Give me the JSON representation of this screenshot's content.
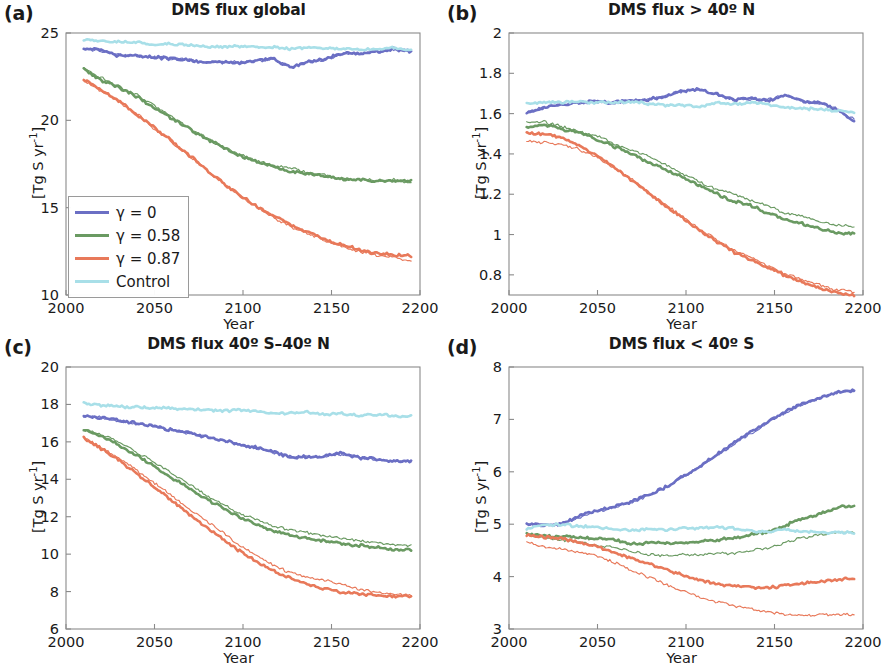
{
  "figure": {
    "panels": [
      {
        "letter": "(a)",
        "title": "DMS flux global",
        "xlabel": "Year",
        "ylabel": "[Tg S yr",
        "ylabel_sup": "-1",
        "ylabel_end": "]"
      },
      {
        "letter": "(b)",
        "title": "DMS flux > 40º N",
        "xlabel": "Year",
        "ylabel": "[Tg S yr",
        "ylabel_sup": "-1",
        "ylabel_end": "]"
      },
      {
        "letter": "(c)",
        "title": "DMS flux 40º S–40º N",
        "xlabel": "Year",
        "ylabel": "[Tg S yr",
        "ylabel_sup": "-1",
        "ylabel_end": "]"
      },
      {
        "letter": "(d)",
        "title": "DMS flux < 40º S",
        "xlabel": "Year",
        "ylabel": "[Tg S yr",
        "ylabel_sup": "-1",
        "ylabel_end": "]"
      }
    ]
  },
  "legend": {
    "position": "lower-left-panel-a",
    "items": [
      {
        "label": "γ = 0",
        "color": "#6b6fc4"
      },
      {
        "label": "γ = 0.58",
        "color": "#6a9a62"
      },
      {
        "label": "γ = 0.87",
        "color": "#e8795a"
      },
      {
        "label": "Control",
        "color": "#a8dfe8"
      }
    ]
  },
  "colors": {
    "gamma_0": "#6b6fc4",
    "gamma_058": "#6a9a62",
    "gamma_087": "#e8795a",
    "control": "#a8dfe8",
    "frame": "#8a8a8a",
    "text": "#1a1a1a",
    "background": "#ffffff"
  },
  "chart_data": [
    {
      "id": "a",
      "type": "line",
      "title": "DMS flux global",
      "xlabel": "Year",
      "ylabel": "[Tg S yr-1]",
      "xlim": [
        2000,
        2200
      ],
      "ylim": [
        10,
        25
      ],
      "xticks": [
        2000,
        2050,
        2100,
        2150,
        2200
      ],
      "yticks": [
        10,
        15,
        20,
        25
      ],
      "grid": false,
      "x": [
        2010,
        2020,
        2030,
        2040,
        2050,
        2060,
        2070,
        2080,
        2090,
        2100,
        2110,
        2120,
        2130,
        2140,
        2150,
        2160,
        2170,
        2180,
        2190,
        2195
      ],
      "series": [
        {
          "name": "γ = 0",
          "color": "#6b6fc4",
          "width": "thick",
          "values": [
            24.1,
            24.05,
            23.7,
            23.75,
            23.6,
            23.55,
            23.5,
            23.3,
            23.35,
            23.3,
            23.4,
            23.55,
            23.0,
            23.35,
            23.5,
            23.85,
            23.8,
            23.95,
            24.1,
            23.95
          ]
        },
        {
          "name": "γ = 0 (b)",
          "color": "#6b6fc4",
          "width": "thin",
          "values": [
            24.1,
            24.0,
            23.75,
            23.7,
            23.65,
            23.5,
            23.5,
            23.35,
            23.3,
            23.35,
            23.4,
            23.5,
            23.05,
            23.4,
            23.45,
            23.8,
            23.85,
            23.9,
            24.05,
            23.95
          ]
        },
        {
          "name": "γ = 0.58",
          "color": "#6a9a62",
          "width": "thick",
          "values": [
            22.95,
            22.3,
            21.9,
            21.4,
            20.8,
            20.2,
            19.6,
            19.0,
            18.5,
            18.0,
            17.65,
            17.35,
            17.05,
            16.95,
            16.8,
            16.65,
            16.6,
            16.5,
            16.55,
            16.5
          ]
        },
        {
          "name": "γ = 0.58 (b)",
          "color": "#6a9a62",
          "width": "thin",
          "values": [
            23.0,
            22.45,
            21.95,
            21.5,
            20.9,
            20.3,
            19.6,
            19.05,
            18.5,
            18.05,
            17.7,
            17.4,
            17.3,
            17.0,
            16.85,
            16.7,
            16.6,
            16.55,
            16.6,
            16.4
          ]
        },
        {
          "name": "γ = 0.87",
          "color": "#e8795a",
          "width": "thick",
          "values": [
            22.35,
            21.75,
            21.1,
            20.4,
            19.65,
            18.9,
            18.1,
            17.3,
            16.5,
            15.75,
            15.1,
            14.55,
            14.0,
            13.6,
            13.2,
            12.85,
            12.6,
            12.4,
            12.3,
            12.25
          ]
        },
        {
          "name": "γ = 0.87 (b)",
          "color": "#e8795a",
          "width": "thin",
          "values": [
            22.3,
            21.7,
            21.1,
            20.45,
            19.6,
            18.85,
            18.05,
            17.25,
            16.45,
            15.7,
            15.05,
            14.45,
            13.9,
            13.5,
            13.1,
            12.75,
            12.5,
            12.3,
            12.15,
            11.95
          ]
        },
        {
          "name": "Control",
          "color": "#a8dfe8",
          "width": "thick",
          "values": [
            24.6,
            24.5,
            24.5,
            24.45,
            24.35,
            24.4,
            24.3,
            24.25,
            24.2,
            24.25,
            24.2,
            24.2,
            24.1,
            24.15,
            24.1,
            24.1,
            24.05,
            24.1,
            24.15,
            24.0
          ]
        }
      ]
    },
    {
      "id": "b",
      "type": "line",
      "title": "DMS flux > 40º N",
      "xlabel": "Year",
      "ylabel": "[Tg S yr-1]",
      "xlim": [
        2000,
        2200
      ],
      "ylim": [
        0.7,
        2.0
      ],
      "xticks": [
        2000,
        2050,
        2100,
        2150,
        2200
      ],
      "yticks": [
        0.8,
        1,
        1.2,
        1.4,
        1.6,
        1.8,
        2
      ],
      "grid": false,
      "x": [
        2010,
        2020,
        2030,
        2040,
        2050,
        2060,
        2070,
        2080,
        2090,
        2100,
        2110,
        2120,
        2130,
        2140,
        2150,
        2160,
        2170,
        2180,
        2190,
        2195
      ],
      "series": [
        {
          "name": "γ = 0",
          "color": "#6b6fc4",
          "width": "thick",
          "values": [
            1.6,
            1.63,
            1.645,
            1.655,
            1.66,
            1.655,
            1.665,
            1.67,
            1.685,
            1.715,
            1.72,
            1.7,
            1.665,
            1.675,
            1.665,
            1.695,
            1.66,
            1.655,
            1.62,
            1.56
          ]
        },
        {
          "name": "γ = 0 (b)",
          "color": "#6b6fc4",
          "width": "thin",
          "values": [
            1.605,
            1.635,
            1.64,
            1.65,
            1.665,
            1.65,
            1.66,
            1.675,
            1.69,
            1.71,
            1.725,
            1.695,
            1.67,
            1.67,
            1.67,
            1.69,
            1.665,
            1.65,
            1.625,
            1.57
          ]
        },
        {
          "name": "γ = 0.58",
          "color": "#6a9a62",
          "width": "thick",
          "values": [
            1.535,
            1.545,
            1.525,
            1.505,
            1.475,
            1.44,
            1.405,
            1.36,
            1.325,
            1.285,
            1.245,
            1.205,
            1.165,
            1.145,
            1.105,
            1.075,
            1.055,
            1.03,
            1.01,
            1.005
          ]
        },
        {
          "name": "γ = 0.58 (b)",
          "color": "#6a9a62",
          "width": "thin",
          "values": [
            1.555,
            1.56,
            1.535,
            1.515,
            1.49,
            1.455,
            1.415,
            1.395,
            1.35,
            1.3,
            1.265,
            1.225,
            1.205,
            1.17,
            1.145,
            1.105,
            1.09,
            1.065,
            1.045,
            1.04
          ]
        },
        {
          "name": "γ = 0.87",
          "color": "#e8795a",
          "width": "thick",
          "values": [
            1.505,
            1.5,
            1.485,
            1.445,
            1.395,
            1.335,
            1.275,
            1.21,
            1.145,
            1.085,
            1.02,
            0.965,
            0.915,
            0.875,
            0.835,
            0.795,
            0.765,
            0.735,
            0.71,
            0.7
          ]
        },
        {
          "name": "γ = 0.87 (b)",
          "color": "#e8795a",
          "width": "thin",
          "values": [
            1.465,
            1.455,
            1.445,
            1.425,
            1.385,
            1.335,
            1.28,
            1.215,
            1.15,
            1.09,
            1.03,
            0.975,
            0.925,
            0.885,
            0.845,
            0.805,
            0.775,
            0.75,
            0.725,
            0.715
          ]
        },
        {
          "name": "Control",
          "color": "#a8dfe8",
          "width": "thick",
          "values": [
            1.655,
            1.655,
            1.655,
            1.66,
            1.655,
            1.655,
            1.66,
            1.65,
            1.64,
            1.645,
            1.635,
            1.655,
            1.645,
            1.655,
            1.645,
            1.63,
            1.625,
            1.62,
            1.615,
            1.61
          ]
        }
      ]
    },
    {
      "id": "c",
      "type": "line",
      "title": "DMS flux 40º S–40º N",
      "xlabel": "Year",
      "ylabel": "[Tg S yr-1]",
      "xlim": [
        2000,
        2200
      ],
      "ylim": [
        6,
        20
      ],
      "xticks": [
        2000,
        2050,
        2100,
        2150,
        2200
      ],
      "yticks": [
        6,
        8,
        10,
        12,
        14,
        16,
        18,
        20
      ],
      "grid": false,
      "x": [
        2010,
        2020,
        2030,
        2040,
        2050,
        2060,
        2070,
        2080,
        2090,
        2100,
        2110,
        2120,
        2130,
        2140,
        2150,
        2160,
        2170,
        2180,
        2190,
        2195
      ],
      "series": [
        {
          "name": "γ = 0",
          "color": "#6b6fc4",
          "width": "thick",
          "values": [
            17.4,
            17.3,
            17.15,
            17.0,
            16.85,
            16.65,
            16.5,
            16.3,
            16.1,
            15.85,
            15.7,
            15.5,
            15.15,
            15.2,
            15.25,
            15.4,
            15.15,
            15.1,
            14.95,
            14.95
          ]
        },
        {
          "name": "γ = 0 (b)",
          "color": "#6b6fc4",
          "width": "thin",
          "values": [
            17.4,
            17.3,
            17.1,
            17.0,
            16.8,
            16.65,
            16.45,
            16.3,
            16.05,
            15.9,
            15.65,
            15.45,
            15.2,
            15.2,
            15.2,
            15.35,
            15.2,
            15.05,
            15.0,
            14.95
          ]
        },
        {
          "name": "γ = 0.58",
          "color": "#6a9a62",
          "width": "thick",
          "values": [
            16.6,
            16.3,
            15.85,
            15.3,
            14.75,
            14.15,
            13.6,
            13.0,
            12.5,
            12.0,
            11.6,
            11.25,
            11.0,
            10.85,
            10.7,
            10.55,
            10.45,
            10.35,
            10.25,
            10.2
          ]
        },
        {
          "name": "γ = 0.58 (b)",
          "color": "#6a9a62",
          "width": "thin",
          "values": [
            16.65,
            16.4,
            16.0,
            15.5,
            14.95,
            14.35,
            13.8,
            13.2,
            12.7,
            12.2,
            11.9,
            11.5,
            11.3,
            11.15,
            10.95,
            10.85,
            10.7,
            10.6,
            10.5,
            10.45
          ]
        },
        {
          "name": "γ = 0.87",
          "color": "#e8795a",
          "width": "thick",
          "values": [
            16.2,
            15.65,
            15.05,
            14.35,
            13.65,
            12.95,
            12.25,
            11.5,
            10.85,
            10.2,
            9.6,
            9.1,
            8.7,
            8.4,
            8.15,
            7.95,
            7.85,
            7.8,
            7.75,
            7.75
          ]
        },
        {
          "name": "γ = 0.87 (b)",
          "color": "#e8795a",
          "width": "thin",
          "values": [
            16.2,
            15.7,
            15.15,
            14.55,
            13.85,
            13.2,
            12.5,
            11.85,
            11.2,
            10.5,
            9.9,
            9.4,
            9.0,
            8.75,
            8.6,
            8.35,
            8.1,
            7.95,
            7.85,
            7.8
          ]
        },
        {
          "name": "Control",
          "color": "#a8dfe8",
          "width": "thick",
          "values": [
            18.05,
            17.95,
            17.9,
            17.85,
            17.85,
            17.8,
            17.75,
            17.7,
            17.65,
            17.7,
            17.65,
            17.5,
            17.55,
            17.6,
            17.45,
            17.5,
            17.4,
            17.45,
            17.4,
            17.4
          ]
        }
      ]
    },
    {
      "id": "d",
      "type": "line",
      "title": "DMS flux < 40º S",
      "xlabel": "Year",
      "ylabel": "[Tg S yr-1]",
      "xlim": [
        2000,
        2200
      ],
      "ylim": [
        3,
        8
      ],
      "xticks": [
        2000,
        2050,
        2100,
        2150,
        2200
      ],
      "yticks": [
        3,
        4,
        5,
        6,
        7,
        8
      ],
      "grid": false,
      "x": [
        2010,
        2020,
        2030,
        2040,
        2050,
        2060,
        2070,
        2080,
        2090,
        2100,
        2110,
        2120,
        2130,
        2140,
        2150,
        2160,
        2170,
        2180,
        2190,
        2195
      ],
      "series": [
        {
          "name": "γ = 0",
          "color": "#6b6fc4",
          "width": "thick",
          "values": [
            5.02,
            4.98,
            5.0,
            5.15,
            5.25,
            5.33,
            5.42,
            5.55,
            5.7,
            5.9,
            6.1,
            6.32,
            6.55,
            6.75,
            6.95,
            7.15,
            7.3,
            7.42,
            7.52,
            7.55
          ]
        },
        {
          "name": "γ = 0 (b)",
          "color": "#6b6fc4",
          "width": "thin",
          "values": [
            5.0,
            4.97,
            5.0,
            5.13,
            5.24,
            5.32,
            5.4,
            5.53,
            5.68,
            5.88,
            6.08,
            6.3,
            6.52,
            6.73,
            6.93,
            7.13,
            7.28,
            7.4,
            7.5,
            7.53
          ]
        },
        {
          "name": "γ = 0.58",
          "color": "#6a9a62",
          "width": "thick",
          "values": [
            4.82,
            4.78,
            4.76,
            4.74,
            4.72,
            4.7,
            4.62,
            4.64,
            4.64,
            4.65,
            4.66,
            4.7,
            4.74,
            4.8,
            4.85,
            4.98,
            5.1,
            5.2,
            5.32,
            5.35
          ]
        },
        {
          "name": "γ = 0.58 (b)",
          "color": "#6a9a62",
          "width": "thin",
          "values": [
            4.8,
            4.74,
            4.7,
            4.66,
            4.6,
            4.56,
            4.48,
            4.42,
            4.4,
            4.42,
            4.42,
            4.44,
            4.45,
            4.5,
            4.55,
            4.65,
            4.74,
            4.8,
            4.84,
            4.84
          ]
        },
        {
          "name": "γ = 0.87",
          "color": "#e8795a",
          "width": "thick",
          "values": [
            4.8,
            4.76,
            4.72,
            4.66,
            4.58,
            4.48,
            4.36,
            4.26,
            4.14,
            4.04,
            3.94,
            3.85,
            3.82,
            3.8,
            3.78,
            3.84,
            3.88,
            3.9,
            3.95,
            3.96
          ]
        },
        {
          "name": "γ = 0.87 (b)",
          "color": "#e8795a",
          "width": "thin",
          "values": [
            4.66,
            4.56,
            4.52,
            4.47,
            4.4,
            4.28,
            4.14,
            4.0,
            3.86,
            3.74,
            3.62,
            3.52,
            3.45,
            3.38,
            3.32,
            3.28,
            3.26,
            3.27,
            3.28,
            3.28
          ]
        },
        {
          "name": "Control",
          "color": "#a8dfe8",
          "width": "thick",
          "values": [
            4.92,
            4.98,
            5.0,
            4.96,
            4.94,
            4.9,
            4.88,
            4.9,
            4.9,
            4.92,
            4.92,
            4.94,
            4.92,
            4.86,
            4.86,
            4.9,
            4.86,
            4.84,
            4.84,
            4.84
          ]
        }
      ]
    }
  ]
}
